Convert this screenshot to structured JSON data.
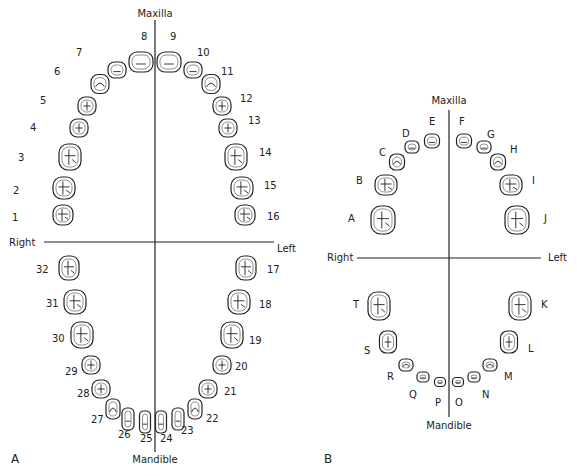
{
  "panel_a": {
    "panel_label": "A",
    "top_label": "Maxilla",
    "bottom_label": "Mandible",
    "right_label": "Right",
    "left_label": "Left",
    "teeth": [
      {
        "id": "1",
        "x": 63,
        "y": 215,
        "lx": 12,
        "ly": 213,
        "w": 20,
        "h": 20,
        "type": "molar"
      },
      {
        "id": "2",
        "x": 64,
        "y": 188,
        "lx": 13,
        "ly": 186,
        "w": 22,
        "h": 22,
        "type": "molar"
      },
      {
        "id": "3",
        "x": 70,
        "y": 157,
        "lx": 18,
        "ly": 153,
        "w": 22,
        "h": 26,
        "type": "molar"
      },
      {
        "id": "4",
        "x": 79,
        "y": 128,
        "lx": 30,
        "ly": 123,
        "w": 18,
        "h": 18,
        "type": "premolar"
      },
      {
        "id": "5",
        "x": 87,
        "y": 106,
        "lx": 40,
        "ly": 96,
        "w": 18,
        "h": 18,
        "type": "premolar"
      },
      {
        "id": "6",
        "x": 100,
        "y": 84,
        "lx": 54,
        "ly": 67,
        "w": 18,
        "h": 19,
        "type": "canine"
      },
      {
        "id": "7",
        "x": 117,
        "y": 70,
        "lx": 76,
        "ly": 48,
        "w": 18,
        "h": 16,
        "type": "incisor"
      },
      {
        "id": "8",
        "x": 141,
        "y": 62,
        "lx": 141,
        "ly": 32,
        "w": 24,
        "h": 20,
        "type": "incisor"
      },
      {
        "id": "9",
        "x": 169,
        "y": 62,
        "lx": 170,
        "ly": 32,
        "w": 24,
        "h": 20,
        "type": "incisor"
      },
      {
        "id": "10",
        "x": 193,
        "y": 70,
        "lx": 197,
        "ly": 48,
        "w": 18,
        "h": 16,
        "type": "incisor"
      },
      {
        "id": "11",
        "x": 211,
        "y": 84,
        "lx": 221,
        "ly": 67,
        "w": 18,
        "h": 19,
        "type": "canine"
      },
      {
        "id": "12",
        "x": 222,
        "y": 106,
        "lx": 240,
        "ly": 94,
        "w": 18,
        "h": 18,
        "type": "premolar"
      },
      {
        "id": "13",
        "x": 228,
        "y": 128,
        "lx": 248,
        "ly": 116,
        "w": 18,
        "h": 18,
        "type": "premolar"
      },
      {
        "id": "14",
        "x": 236,
        "y": 157,
        "lx": 259,
        "ly": 148,
        "w": 22,
        "h": 26,
        "type": "molar"
      },
      {
        "id": "15",
        "x": 242,
        "y": 188,
        "lx": 264,
        "ly": 181,
        "w": 22,
        "h": 22,
        "type": "molar"
      },
      {
        "id": "16",
        "x": 245,
        "y": 215,
        "lx": 267,
        "ly": 212,
        "w": 20,
        "h": 20,
        "type": "molar"
      },
      {
        "id": "17",
        "x": 246,
        "y": 268,
        "lx": 267,
        "ly": 265,
        "w": 20,
        "h": 24,
        "type": "molar"
      },
      {
        "id": "18",
        "x": 239,
        "y": 302,
        "lx": 259,
        "ly": 300,
        "w": 22,
        "h": 24,
        "type": "molar"
      },
      {
        "id": "19",
        "x": 232,
        "y": 335,
        "lx": 249,
        "ly": 336,
        "w": 22,
        "h": 26,
        "type": "molar"
      },
      {
        "id": "20",
        "x": 222,
        "y": 365,
        "lx": 235,
        "ly": 362,
        "w": 18,
        "h": 18,
        "type": "premolar"
      },
      {
        "id": "21",
        "x": 208,
        "y": 389,
        "lx": 224,
        "ly": 387,
        "w": 18,
        "h": 18,
        "type": "premolar"
      },
      {
        "id": "22",
        "x": 195,
        "y": 409,
        "lx": 206,
        "ly": 414,
        "w": 14,
        "h": 20,
        "type": "canine"
      },
      {
        "id": "23",
        "x": 178,
        "y": 419,
        "lx": 181,
        "ly": 426,
        "w": 12,
        "h": 22,
        "type": "incisor"
      },
      {
        "id": "24",
        "x": 161,
        "y": 422,
        "lx": 160,
        "ly": 434,
        "w": 11,
        "h": 22,
        "type": "incisor"
      },
      {
        "id": "25",
        "x": 145,
        "y": 422,
        "lx": 140,
        "ly": 434,
        "w": 11,
        "h": 22,
        "type": "incisor"
      },
      {
        "id": "26",
        "x": 128,
        "y": 419,
        "lx": 118,
        "ly": 430,
        "w": 12,
        "h": 22,
        "type": "incisor"
      },
      {
        "id": "27",
        "x": 113,
        "y": 409,
        "lx": 91,
        "ly": 415,
        "w": 14,
        "h": 20,
        "type": "canine"
      },
      {
        "id": "28",
        "x": 101,
        "y": 389,
        "lx": 77,
        "ly": 389,
        "w": 18,
        "h": 18,
        "type": "premolar"
      },
      {
        "id": "29",
        "x": 91,
        "y": 365,
        "lx": 65,
        "ly": 367,
        "w": 18,
        "h": 18,
        "type": "premolar"
      },
      {
        "id": "30",
        "x": 82,
        "y": 335,
        "lx": 52,
        "ly": 334,
        "w": 22,
        "h": 26,
        "type": "molar"
      },
      {
        "id": "31",
        "x": 75,
        "y": 302,
        "lx": 46,
        "ly": 299,
        "w": 22,
        "h": 24,
        "type": "molar"
      },
      {
        "id": "32",
        "x": 69,
        "y": 268,
        "lx": 36,
        "ly": 265,
        "w": 20,
        "h": 24,
        "type": "molar"
      }
    ]
  },
  "panel_b": {
    "panel_label": "B",
    "top_label": "Maxilla",
    "bottom_label": "Mandible",
    "right_label": "Right",
    "left_label": "Left",
    "teeth": [
      {
        "id": "A",
        "x": 383,
        "y": 220,
        "lx": 348,
        "ly": 214,
        "w": 24,
        "h": 28,
        "type": "molar"
      },
      {
        "id": "B",
        "x": 386,
        "y": 185,
        "lx": 356,
        "ly": 176,
        "w": 22,
        "h": 20,
        "type": "molar"
      },
      {
        "id": "C",
        "x": 397,
        "y": 162,
        "lx": 379,
        "ly": 148,
        "w": 15,
        "h": 16,
        "type": "canine"
      },
      {
        "id": "D",
        "x": 412,
        "y": 147,
        "lx": 402,
        "ly": 129,
        "w": 14,
        "h": 12,
        "type": "incisor"
      },
      {
        "id": "E",
        "x": 432,
        "y": 141,
        "lx": 429,
        "ly": 117,
        "w": 15,
        "h": 14,
        "type": "incisor"
      },
      {
        "id": "F",
        "x": 464,
        "y": 141,
        "lx": 459,
        "ly": 117,
        "w": 15,
        "h": 14,
        "type": "incisor"
      },
      {
        "id": "G",
        "x": 484,
        "y": 147,
        "lx": 487,
        "ly": 130,
        "w": 14,
        "h": 12,
        "type": "incisor"
      },
      {
        "id": "H",
        "x": 498,
        "y": 162,
        "lx": 510,
        "ly": 145,
        "w": 15,
        "h": 16,
        "type": "canine"
      },
      {
        "id": "I",
        "x": 511,
        "y": 185,
        "lx": 532,
        "ly": 176,
        "w": 22,
        "h": 20,
        "type": "molar"
      },
      {
        "id": "J",
        "x": 517,
        "y": 220,
        "lx": 544,
        "ly": 214,
        "w": 24,
        "h": 28,
        "type": "molar"
      },
      {
        "id": "K",
        "x": 520,
        "y": 306,
        "lx": 541,
        "ly": 300,
        "w": 22,
        "h": 28,
        "type": "molar"
      },
      {
        "id": "L",
        "x": 509,
        "y": 342,
        "lx": 528,
        "ly": 344,
        "w": 17,
        "h": 22,
        "type": "premolar"
      },
      {
        "id": "M",
        "x": 490,
        "y": 365,
        "lx": 504,
        "ly": 372,
        "w": 14,
        "h": 12,
        "type": "canine"
      },
      {
        "id": "N",
        "x": 474,
        "y": 377,
        "lx": 482,
        "ly": 390,
        "w": 12,
        "h": 10,
        "type": "incisor"
      },
      {
        "id": "O",
        "x": 458,
        "y": 382,
        "lx": 455,
        "ly": 398,
        "w": 11,
        "h": 9,
        "type": "incisor"
      },
      {
        "id": "P",
        "x": 440,
        "y": 382,
        "lx": 435,
        "ly": 398,
        "w": 11,
        "h": 9,
        "type": "incisor"
      },
      {
        "id": "Q",
        "x": 423,
        "y": 377,
        "lx": 409,
        "ly": 390,
        "w": 12,
        "h": 10,
        "type": "incisor"
      },
      {
        "id": "R",
        "x": 406,
        "y": 365,
        "lx": 387,
        "ly": 372,
        "w": 14,
        "h": 12,
        "type": "canine"
      },
      {
        "id": "S",
        "x": 388,
        "y": 342,
        "lx": 364,
        "ly": 346,
        "w": 17,
        "h": 22,
        "type": "premolar"
      },
      {
        "id": "T",
        "x": 379,
        "y": 306,
        "lx": 353,
        "ly": 300,
        "w": 22,
        "h": 28,
        "type": "molar"
      }
    ]
  }
}
